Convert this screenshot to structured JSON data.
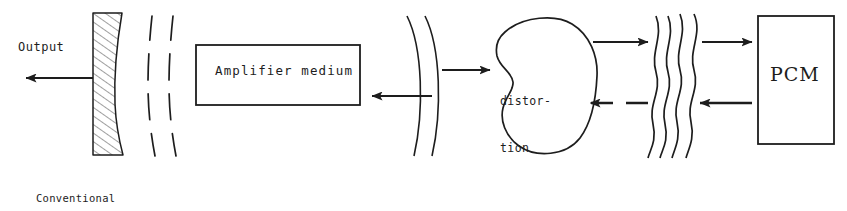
{
  "figure": {
    "ink_color": "#1d1d1d",
    "background": "#ffffff"
  },
  "labels": {
    "output": "Output",
    "reflector_caption_line1": "Conventional",
    "reflector_caption_line2": "reflector",
    "amplifier": "Amplifier medium",
    "distortion_line1": "distor-",
    "distortion_line2": "tion",
    "pcm": "PCM"
  },
  "components": [
    {
      "name": "conventional-reflector",
      "kind": "hatched-curved-mirror",
      "label": "Conventional reflector"
    },
    {
      "name": "broken-wavefronts",
      "kind": "dashed-arc-pair",
      "segments_per_arc": 4,
      "arcs": 2
    },
    {
      "name": "amplifier-medium",
      "kind": "rectangle",
      "label": "Amplifier medium"
    },
    {
      "name": "smooth-wavefronts",
      "kind": "arc-pair",
      "arcs": 2
    },
    {
      "name": "distortion-blob",
      "kind": "freeform-blob",
      "label": "distortion"
    },
    {
      "name": "distorted-wavefronts",
      "kind": "wavy-line-group",
      "lines": 4
    },
    {
      "name": "phase-conjugate-mirror",
      "kind": "rectangle",
      "label": "PCM"
    }
  ],
  "arrows": [
    {
      "name": "output-arrow",
      "direction": "left",
      "style": "solid"
    },
    {
      "name": "return-beam-arrow",
      "direction": "left",
      "style": "solid"
    },
    {
      "name": "forward-beam-arrow",
      "direction": "right",
      "style": "solid"
    },
    {
      "name": "blob-to-pcm-arrow",
      "direction": "right",
      "style": "solid"
    },
    {
      "name": "pcm-return-arrow",
      "direction": "left",
      "style": "dashed"
    },
    {
      "name": "pcm-input-arrow",
      "direction": "right",
      "style": "solid"
    },
    {
      "name": "pcm-output-arrow",
      "direction": "left",
      "style": "solid"
    }
  ]
}
